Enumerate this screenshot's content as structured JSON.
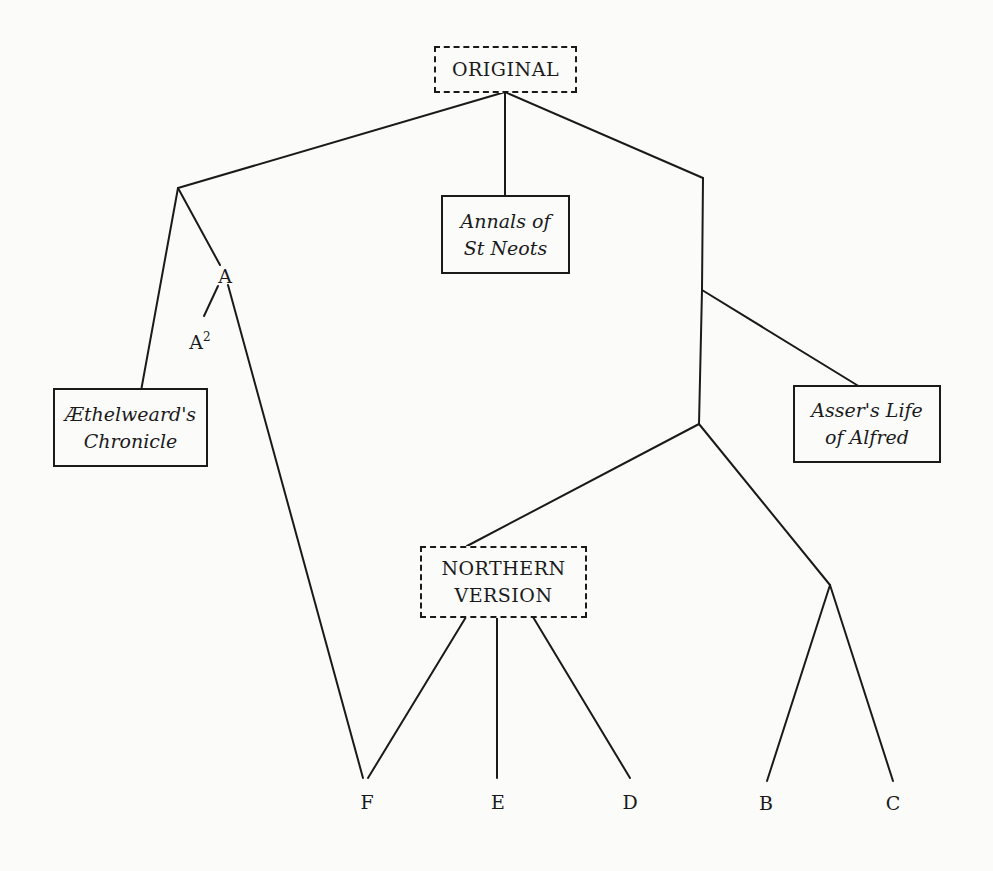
{
  "diagram": {
    "type": "stemma / manuscript family tree",
    "colors": {
      "line": "#1a1a1a",
      "background": "#fbfbfa"
    },
    "nodes": {
      "original": {
        "label": "ORIGINAL",
        "style": "dashed-box"
      },
      "annals": {
        "label": "Annals of\nSt Neots",
        "style": "solid-box-italic"
      },
      "aethelweard": {
        "label": "Æthelweard's\nChronicle",
        "style": "solid-box-italic"
      },
      "asser": {
        "label": "Asser's Life\nof Alfred",
        "style": "solid-box-italic"
      },
      "northern": {
        "label": "NORTHERN\nVERSION",
        "style": "dashed-box"
      },
      "a": {
        "label": "A"
      },
      "a2": {
        "label": "A",
        "sup": "2"
      },
      "f": {
        "label": "F"
      },
      "e": {
        "label": "E"
      },
      "d": {
        "label": "D"
      },
      "b": {
        "label": "B"
      },
      "c": {
        "label": "C"
      }
    },
    "edges": [
      {
        "from": "ORIGINAL",
        "to": "left junction"
      },
      {
        "from": "ORIGINAL",
        "to": "Annals of St Neots"
      },
      {
        "from": "ORIGINAL",
        "to": "right junction"
      },
      {
        "from": "left junction",
        "to": "Æthelweard's Chronicle"
      },
      {
        "from": "left junction",
        "to": "A"
      },
      {
        "from": "A",
        "to": "A2"
      },
      {
        "from": "A",
        "to": "F"
      },
      {
        "from": "right junction",
        "to": "Asser's Life of Alfred"
      },
      {
        "from": "right junction",
        "to": "lower right junction"
      },
      {
        "from": "lower right junction",
        "to": "NORTHERN VERSION"
      },
      {
        "from": "lower right junction",
        "to": "B/C junction"
      },
      {
        "from": "NORTHERN VERSION",
        "to": "F"
      },
      {
        "from": "NORTHERN VERSION",
        "to": "E"
      },
      {
        "from": "NORTHERN VERSION",
        "to": "D"
      },
      {
        "from": "B/C junction",
        "to": "B"
      },
      {
        "from": "B/C junction",
        "to": "C"
      }
    ]
  }
}
